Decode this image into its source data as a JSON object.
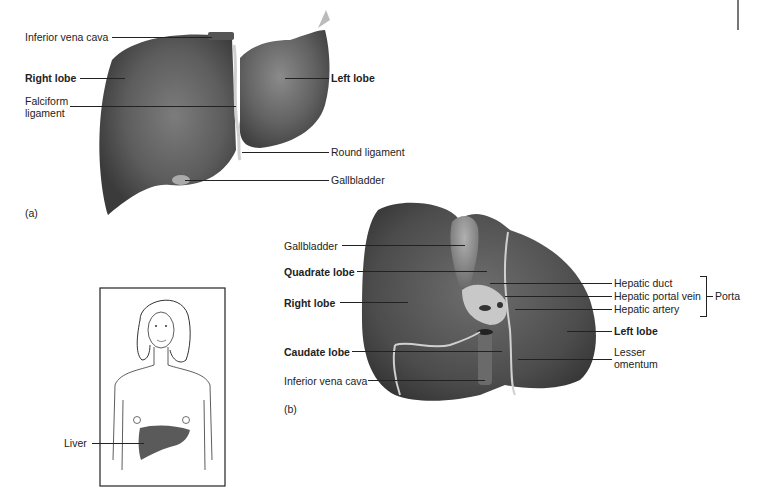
{
  "figure_a": {
    "panel_label": "(a)",
    "view": "anterior",
    "labels": {
      "inferior_vena_cava": "Inferior vena cava",
      "right_lobe": "Right lobe",
      "falciform_ligament": "Falciform ligament",
      "left_lobe": "Left lobe",
      "round_ligament": "Round ligament",
      "gallbladder": "Gallbladder"
    }
  },
  "figure_b": {
    "panel_label": "(b)",
    "view": "inferior",
    "labels": {
      "gallbladder": "Gallbladder",
      "quadrate_lobe": "Quadrate lobe",
      "right_lobe": "Right lobe",
      "caudate_lobe": "Caudate lobe",
      "inferior_vena_cava": "Inferior vena cava",
      "hepatic_duct": "Hepatic duct",
      "hepatic_portal_vein": "Hepatic portal vein",
      "hepatic_artery": "Hepatic artery",
      "porta": "Porta",
      "left_lobe": "Left lobe",
      "lesser_omentum": "Lesser omentum"
    }
  },
  "figure_inset": {
    "labels": {
      "liver": "Liver"
    }
  },
  "colors": {
    "liver_dark": "#4a4a4a",
    "liver_mid": "#6b6b6b",
    "liver_light": "#8e8e8e",
    "text": "#222222"
  }
}
